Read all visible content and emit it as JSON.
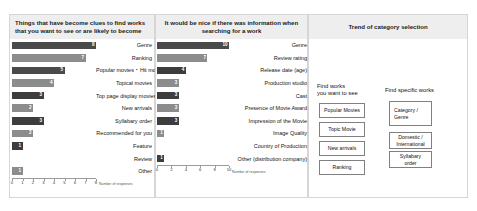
{
  "slide": {
    "title_hidden": ""
  },
  "panels": [
    {
      "id": "panel-clues",
      "title": "Things that have become clues to find works that you want to see or are likely to become",
      "axis_title": "Number of responses"
    },
    {
      "id": "panel-nice-info",
      "title": "It would be nice if there was information when searching for a work",
      "axis_title": "Number of responses"
    },
    {
      "id": "panel-trend",
      "title": "Trend of category selection"
    }
  ],
  "diagram": {
    "left_title": "Find works\nyou want to see",
    "left_title_line1": "Find works",
    "left_title_line2": "you want to see",
    "right_title": "Find specific works",
    "left_boxes": [
      "Popular Movies",
      "Topic Movie",
      "New arrivals",
      "Ranking"
    ],
    "right_boxes": [
      "Category /\nGenre",
      "Domestic /\nInternational",
      "Syllabary\norder"
    ],
    "right_box_0_l1": "Category /",
    "right_box_0_l2": "Genre",
    "right_box_1_l1": "Domestic /",
    "right_box_1_l2": "International",
    "right_box_2_l1": "Syllabary",
    "right_box_2_l2": "order"
  },
  "chart_data": [
    {
      "type": "bar",
      "orientation": "horizontal",
      "title": "Things that have become clues to find works that you want to see or are likely to become",
      "xlabel": "Number of responses",
      "ylabel": "",
      "xlim": [
        0,
        8
      ],
      "xticks": [
        0,
        1,
        2,
        3,
        4,
        5,
        6,
        7,
        8
      ],
      "grid": false,
      "legend": "none",
      "categories": [
        "Genre",
        "Ranking",
        "Popular movies・Hit movies",
        "Topical movies",
        "Top page display movies",
        "New arrivals",
        "Syllabary order",
        "Recommended for you",
        "Feature",
        "Review",
        "Other"
      ],
      "values": [
        8,
        7,
        5,
        4,
        3,
        2,
        3,
        2,
        1,
        0,
        1
      ],
      "bar_colors": [
        "#4a4a4a",
        "#8c8c8c",
        "#4a4a4a",
        "#8c8c8c",
        "#3d3d3d",
        "#8c8c8c",
        "#3d3d3d",
        "#8c8c8c",
        "#3d3d3d",
        "#8c8c8c",
        "#8c8c8c"
      ]
    },
    {
      "type": "bar",
      "orientation": "horizontal",
      "title": "It would be nice if there was information when searching for a work",
      "xlabel": "Number of responses",
      "ylabel": "",
      "xlim": [
        0,
        10
      ],
      "xticks": [
        0,
        2,
        4,
        6,
        8,
        10
      ],
      "grid": false,
      "legend": "none",
      "categories": [
        "Genre",
        "Review rating",
        "Release date (age)",
        "Production studio",
        "Cast",
        "Presence of Movie Award",
        "Impression of the Movie",
        "Image Quality",
        "Country of Production",
        "Other (distribution company)"
      ],
      "values": [
        10,
        7,
        4,
        3,
        3,
        3,
        3,
        1,
        0,
        1
      ],
      "bar_colors": [
        "#4a4a4a",
        "#8c8c8c",
        "#3d3d3d",
        "#8c8c8c",
        "#3d3d3d",
        "#8c8c8c",
        "#3d3d3d",
        "#8c8c8c",
        "#8c8c8c",
        "#3d3d3d"
      ]
    }
  ]
}
